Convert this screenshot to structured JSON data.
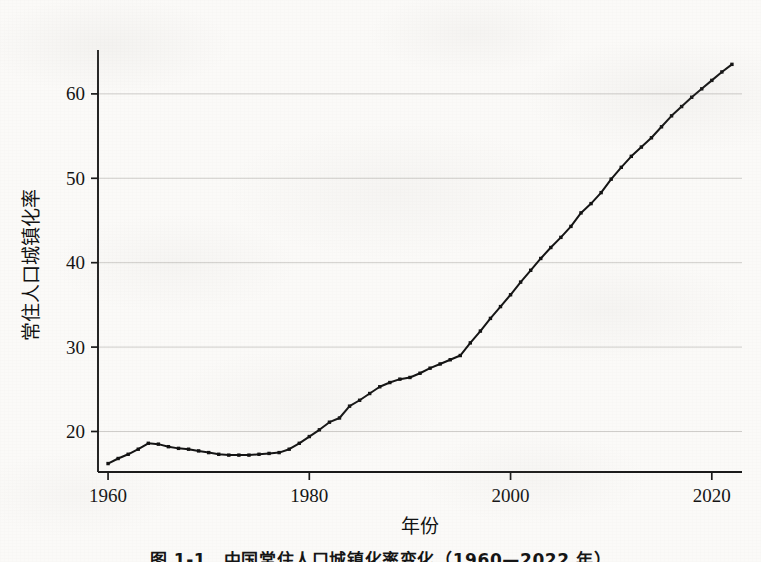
{
  "figure": {
    "caption": "图 1-1　中国常住人口城镇化率变化（1960—2022 年）"
  },
  "chart_data": {
    "type": "line",
    "title": "",
    "subtitle": "",
    "xlabel": "年份",
    "ylabel": "常住人口城镇化率",
    "xlim": [
      1959,
      2023
    ],
    "ylim": [
      15.2,
      65.2
    ],
    "xticks": [
      1960,
      1980,
      2000,
      2020
    ],
    "xtick_labels": [
      "1960",
      "1980",
      "2000",
      "2020"
    ],
    "yticks": [
      20,
      30,
      40,
      50,
      60
    ],
    "ytick_labels": [
      "20",
      "30",
      "40",
      "50",
      "60"
    ],
    "grid": "horizontal",
    "legend": "none",
    "marker": "small-square",
    "line_color": "#141414",
    "grid_color": "#c9c7c4",
    "series": [
      {
        "name": "常住人口城镇化率",
        "x": [
          1960,
          1961,
          1962,
          1963,
          1964,
          1965,
          1966,
          1967,
          1968,
          1969,
          1970,
          1971,
          1972,
          1973,
          1974,
          1975,
          1976,
          1977,
          1978,
          1979,
          1980,
          1981,
          1982,
          1983,
          1984,
          1985,
          1986,
          1987,
          1988,
          1989,
          1990,
          1991,
          1992,
          1993,
          1994,
          1995,
          1996,
          1997,
          1998,
          1999,
          2000,
          2001,
          2002,
          2003,
          2004,
          2005,
          2006,
          2007,
          2008,
          2009,
          2010,
          2011,
          2012,
          2013,
          2014,
          2015,
          2016,
          2017,
          2018,
          2019,
          2020,
          2021,
          2022
        ],
        "values": [
          16.2,
          16.8,
          17.3,
          17.9,
          18.6,
          18.5,
          18.2,
          18.0,
          17.9,
          17.7,
          17.5,
          17.3,
          17.2,
          17.2,
          17.2,
          17.3,
          17.4,
          17.5,
          17.9,
          18.6,
          19.4,
          20.2,
          21.1,
          21.6,
          23.0,
          23.7,
          24.5,
          25.3,
          25.8,
          26.2,
          26.4,
          26.9,
          27.5,
          28.0,
          28.5,
          29.0,
          30.5,
          31.9,
          33.4,
          34.8,
          36.2,
          37.7,
          39.1,
          40.5,
          41.8,
          43.0,
          44.3,
          45.9,
          47.0,
          48.3,
          49.9,
          51.3,
          52.6,
          53.7,
          54.8,
          56.1,
          57.4,
          58.5,
          59.6,
          60.6,
          61.6,
          62.6,
          63.5
        ]
      }
    ]
  }
}
